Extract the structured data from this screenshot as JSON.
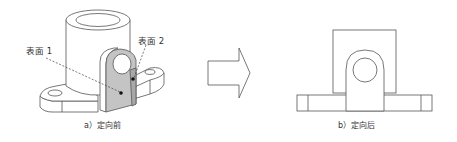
{
  "figure": {
    "left_panel": {
      "caption": "a）定向前",
      "labels": {
        "surface1": "表面 1",
        "surface2": "表面 2"
      },
      "view": "isometric"
    },
    "arrow": {
      "direction": "right",
      "icon": "hollow-right-arrow-icon"
    },
    "right_panel": {
      "caption": "b）定向后",
      "view": "front-orthographic"
    },
    "colors": {
      "line": "#555555",
      "shade_face": "#c4c4c4",
      "shade_side": "#a8a8a8",
      "background": "#ffffff"
    }
  }
}
